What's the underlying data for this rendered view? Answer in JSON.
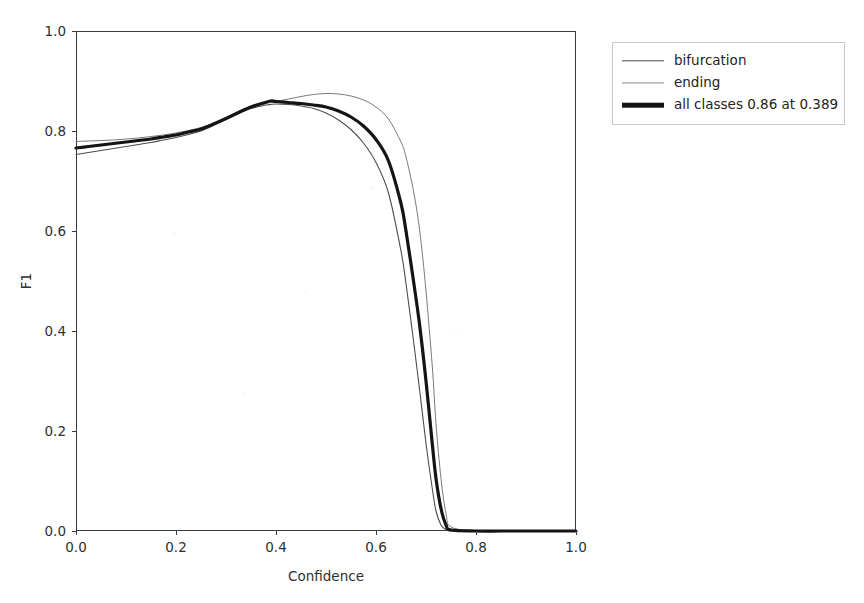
{
  "chart_data": {
    "type": "line",
    "title": "",
    "xlabel": "Confidence",
    "ylabel": "F1",
    "xlim": [
      0.0,
      1.0
    ],
    "ylim": [
      0.0,
      1.0
    ],
    "xticks": [
      "0.0",
      "0.2",
      "0.4",
      "0.6",
      "0.8",
      "1.0"
    ],
    "yticks": [
      "0.0",
      "0.2",
      "0.4",
      "0.6",
      "0.8",
      "1.0"
    ],
    "xtick_values": [
      0.0,
      0.2,
      0.4,
      0.6,
      0.8,
      1.0
    ],
    "ytick_values": [
      0.0,
      0.2,
      0.4,
      0.6,
      0.8,
      1.0
    ],
    "grid": false,
    "legend_position": "upper right outside",
    "x": [
      0.0,
      0.025,
      0.05,
      0.075,
      0.1,
      0.125,
      0.15,
      0.175,
      0.2,
      0.225,
      0.25,
      0.275,
      0.3,
      0.325,
      0.35,
      0.375,
      0.389,
      0.4,
      0.425,
      0.45,
      0.475,
      0.5,
      0.525,
      0.55,
      0.575,
      0.6,
      0.625,
      0.65,
      0.66,
      0.675,
      0.6875,
      0.7,
      0.7125,
      0.72,
      0.73,
      0.74,
      0.75,
      0.8,
      0.85,
      0.9,
      0.95,
      1.0
    ],
    "series": [
      {
        "name": "bifurcation",
        "color": "#4d4d4d",
        "linewidth": 1.1,
        "values": [
          0.753,
          0.757,
          0.761,
          0.765,
          0.769,
          0.773,
          0.777,
          0.782,
          0.787,
          0.793,
          0.8,
          0.811,
          0.823,
          0.835,
          0.845,
          0.851,
          0.853,
          0.854,
          0.853,
          0.85,
          0.845,
          0.836,
          0.822,
          0.803,
          0.776,
          0.737,
          0.676,
          0.56,
          0.495,
          0.38,
          0.28,
          0.175,
          0.085,
          0.04,
          0.012,
          0.003,
          0.0,
          0.0,
          0.0,
          0.0,
          0.0,
          0.0
        ]
      },
      {
        "name": "ending",
        "color": "#7a7a7a",
        "linewidth": 1.0,
        "values": [
          0.779,
          0.78,
          0.781,
          0.782,
          0.784,
          0.786,
          0.789,
          0.792,
          0.796,
          0.801,
          0.807,
          0.815,
          0.825,
          0.836,
          0.846,
          0.854,
          0.857,
          0.859,
          0.864,
          0.869,
          0.873,
          0.875,
          0.874,
          0.87,
          0.862,
          0.848,
          0.824,
          0.778,
          0.748,
          0.68,
          0.6,
          0.48,
          0.33,
          0.215,
          0.105,
          0.035,
          0.008,
          0.0,
          0.0,
          0.0,
          0.0,
          0.0
        ]
      },
      {
        "name": "all classes 0.86 at 0.389",
        "color": "#141414",
        "linewidth": 3.2,
        "values": [
          0.766,
          0.769,
          0.772,
          0.775,
          0.778,
          0.781,
          0.784,
          0.788,
          0.792,
          0.798,
          0.804,
          0.814,
          0.825,
          0.837,
          0.848,
          0.856,
          0.86,
          0.859,
          0.857,
          0.855,
          0.852,
          0.848,
          0.84,
          0.828,
          0.81,
          0.783,
          0.74,
          0.655,
          0.6,
          0.5,
          0.41,
          0.3,
          0.175,
          0.105,
          0.045,
          0.012,
          0.002,
          0.0,
          0.0,
          0.0,
          0.0,
          0.0
        ]
      }
    ],
    "annotations": {
      "best_value": "0.86",
      "best_confidence": "0.389"
    }
  },
  "legend": {
    "entries": [
      {
        "label": "bifurcation"
      },
      {
        "label": "ending"
      },
      {
        "label": "all classes 0.86 at 0.389"
      }
    ]
  },
  "axes": {
    "xlabel": "Confidence",
    "ylabel": "F1",
    "xticks": [
      "0.0",
      "0.2",
      "0.4",
      "0.6",
      "0.8",
      "1.0"
    ],
    "yticks": [
      "0.0",
      "0.2",
      "0.4",
      "0.6",
      "0.8",
      "1.0"
    ]
  }
}
